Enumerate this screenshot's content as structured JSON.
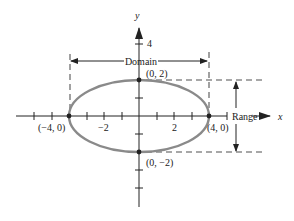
{
  "diagram": {
    "axes": {
      "x_label": "x",
      "y_label": "y",
      "x_ticks": {
        "neg2": "−2",
        "pos2": "2"
      },
      "y_ticks": {
        "pos4": "4"
      }
    },
    "points": {
      "top": "(0, 2)",
      "bottom": "(0, −2)",
      "left": "(−4, 0)",
      "right": "(4, 0)"
    },
    "annotations": {
      "domain": "Domain",
      "range": "Range"
    },
    "ellipse": {
      "center": [
        0,
        0
      ],
      "semi_major_x": 4,
      "semi_minor_y": 2
    },
    "colors": {
      "ellipse": "#8a8a8a",
      "dashes": "#8a8a8a",
      "axis": "#222222"
    }
  }
}
